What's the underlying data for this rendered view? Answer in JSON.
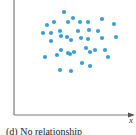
{
  "figure": {
    "caption": "(d) No relationship",
    "x_axis_label": "x",
    "y_axis_label": "",
    "colors": {
      "point": "#3a9fd8",
      "axis": "#777777",
      "text": "#222222"
    }
  },
  "chart_data": {
    "type": "scatter",
    "title": "(d) No relationship",
    "xlabel": "x",
    "ylabel": "",
    "grid": false,
    "axis_ticks": false,
    "note": "Point coordinates are pixel positions within the 136x135 figure (y increases downward); no numeric scale is shown.",
    "points": [
      [
        64,
        12
      ],
      [
        73,
        18
      ],
      [
        68,
        22
      ],
      [
        80,
        22
      ],
      [
        88,
        22
      ],
      [
        102,
        19
      ],
      [
        114,
        24
      ],
      [
        47,
        25
      ],
      [
        54,
        22
      ],
      [
        43,
        33
      ],
      [
        51,
        33
      ],
      [
        60,
        31
      ],
      [
        78,
        31
      ],
      [
        89,
        30
      ],
      [
        98,
        31
      ],
      [
        61,
        36
      ],
      [
        67,
        37
      ],
      [
        71,
        40
      ],
      [
        81,
        38
      ],
      [
        88,
        39
      ],
      [
        102,
        38
      ],
      [
        116,
        37
      ],
      [
        51,
        41
      ],
      [
        61,
        50
      ],
      [
        68,
        53
      ],
      [
        70,
        54
      ],
      [
        74,
        52
      ],
      [
        86,
        48
      ],
      [
        90,
        52
      ],
      [
        95,
        50
      ],
      [
        105,
        50
      ],
      [
        45,
        57
      ],
      [
        57,
        55
      ],
      [
        108,
        57
      ],
      [
        82,
        63
      ],
      [
        90,
        66
      ],
      [
        60,
        70
      ],
      [
        71,
        71
      ]
    ]
  }
}
